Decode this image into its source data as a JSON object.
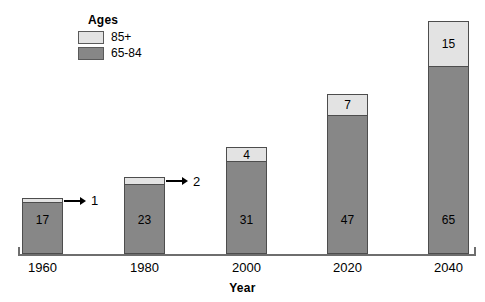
{
  "legend": {
    "title": "Ages",
    "entries": [
      {
        "label": "85+",
        "color": "#e3e3e3"
      },
      {
        "label": "65-84",
        "color": "#878787"
      }
    ]
  },
  "axis": {
    "x_title": "Year",
    "tick_labels": [
      "1960",
      "1980",
      "2000",
      "2020",
      "2040"
    ]
  },
  "chart_data": {
    "type": "bar",
    "title": "",
    "subtitle": "",
    "xlabel": "Year",
    "ylabel": "",
    "stacked": true,
    "grid": false,
    "legend_position": "top-left",
    "legend_title": "Ages",
    "categories": [
      "1960",
      "1980",
      "2000",
      "2020",
      "2040"
    ],
    "series": [
      {
        "name": "65-84",
        "color": "#878787",
        "values": [
          17,
          23,
          31,
          47,
          65
        ]
      },
      {
        "name": "85+",
        "color": "#e3e3e3",
        "values": [
          1,
          2,
          4,
          7,
          15
        ]
      }
    ],
    "totals": [
      18,
      25,
      35,
      54,
      80
    ],
    "annotations": [
      {
        "category": "1960",
        "series": "85+",
        "text": "1",
        "style": "arrow-callout"
      },
      {
        "category": "1980",
        "series": "85+",
        "text": "2",
        "style": "arrow-callout"
      }
    ],
    "ylim": [
      0,
      82
    ],
    "bar_labels_inside": true
  },
  "bars": [
    {
      "year": "1960",
      "lower_value": "17",
      "upper_value": "1",
      "upper_callout": true,
      "left_px": 22,
      "lower_h_px": 52,
      "upper_h_px": 5
    },
    {
      "year": "1980",
      "lower_value": "23",
      "upper_value": "2",
      "upper_callout": true,
      "left_px": 124,
      "lower_h_px": 70,
      "upper_h_px": 8
    },
    {
      "year": "2000",
      "lower_value": "31",
      "upper_value": "4",
      "upper_callout": false,
      "left_px": 226,
      "lower_h_px": 93,
      "upper_h_px": 15
    },
    {
      "year": "2020",
      "lower_value": "47",
      "upper_value": "7",
      "upper_callout": false,
      "left_px": 327,
      "lower_h_px": 139,
      "upper_h_px": 22
    },
    {
      "year": "2040",
      "lower_value": "65",
      "upper_value": "15",
      "upper_callout": false,
      "left_px": 428,
      "lower_h_px": 188,
      "upper_h_px": 46
    }
  ]
}
